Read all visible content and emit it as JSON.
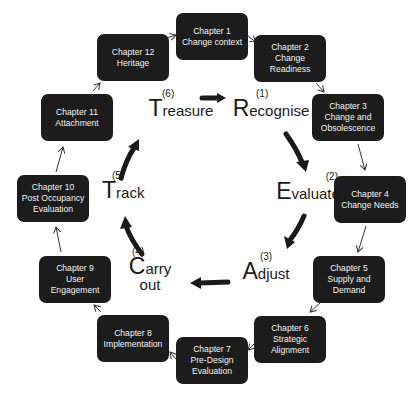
{
  "chapters": [
    {
      "title": "Chapter 1",
      "lines": [
        "Change context"
      ]
    },
    {
      "title": "Chapter 2",
      "lines": [
        "Change",
        "Readiness"
      ]
    },
    {
      "title": "Chapter 3",
      "lines": [
        "Change and",
        "Obsolescence"
      ]
    },
    {
      "title": "Chapter 4",
      "lines": [
        "Change Needs"
      ]
    },
    {
      "title": "Chapter 5",
      "lines": [
        "Supply and",
        "Demand"
      ]
    },
    {
      "title": "Chapter 6",
      "lines": [
        "Strategic",
        "Alignment"
      ]
    },
    {
      "title": "Chapter 7",
      "lines": [
        "Pre-Design",
        "Evaluation"
      ]
    },
    {
      "title": "Chapter 8",
      "lines": [
        "Implementation"
      ]
    },
    {
      "title": "Chapter 9",
      "lines": [
        "User",
        "Engagement"
      ]
    },
    {
      "title": "Chapter 10",
      "lines": [
        "Post Occupancy",
        "Evaluation"
      ]
    },
    {
      "title": "Chapter 11",
      "lines": [
        "Attachment"
      ]
    },
    {
      "title": "Chapter 12",
      "lines": [
        "Heritage"
      ]
    }
  ],
  "stages": [
    {
      "num": "(1)",
      "initial": "R",
      "rest": "ecognise",
      "second_line": ""
    },
    {
      "num": "(2)",
      "initial": "E",
      "rest": "valuate",
      "second_line": ""
    },
    {
      "num": "(3)",
      "initial": "A",
      "rest": "djust",
      "second_line": ""
    },
    {
      "num": "(4)",
      "initial": "C",
      "rest": "arry",
      "second_line": "out"
    },
    {
      "num": "(5)",
      "initial": "T",
      "rest": "rack",
      "second_line": ""
    },
    {
      "num": "(6)",
      "initial": "T",
      "rest": "reasure",
      "second_line": ""
    }
  ],
  "colors": {
    "box_fill": "#1c1c1c",
    "box_text": "#f2f2f2",
    "arrow": "#1a1a1a",
    "background": "#ffffff"
  }
}
